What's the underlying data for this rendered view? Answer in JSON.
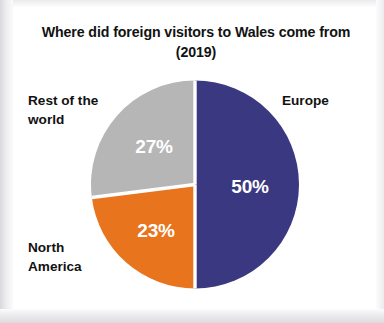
{
  "chart_data": {
    "type": "pie",
    "title": "Where did foreign visitors to Wales come from (2019)",
    "title_line1": "Where did foreign visitors to Wales come from",
    "title_line2": "(2019)",
    "xlabel": "",
    "ylabel": "",
    "legend_position": "outside-labels",
    "grid": false,
    "categories": [
      "Europe",
      "Rest of the world",
      "North America"
    ],
    "values": [
      50,
      27,
      23
    ],
    "value_labels": [
      "50%",
      "27%",
      "23%"
    ],
    "colors": [
      "#3a3880",
      "#b6b6b6",
      "#e8741e"
    ],
    "slices": [
      {
        "label": "Europe",
        "label_text": "Europe",
        "value": 50,
        "value_label": "50%",
        "color": "#3a3880",
        "start_angle_deg": 0,
        "end_angle_deg": 180
      },
      {
        "label": "North America",
        "label_text": "North\nAmerica",
        "value": 23,
        "value_label": "23%",
        "color": "#e8741e",
        "start_angle_deg": 180,
        "end_angle_deg": 262.8
      },
      {
        "label": "Rest of the world",
        "label_text": "Rest of the\nworld",
        "value": 27,
        "value_label": "27%",
        "color": "#b6b6b6",
        "start_angle_deg": 262.8,
        "end_angle_deg": 360
      }
    ],
    "total": 100,
    "units": "%",
    "separator_color": "#ffffff",
    "background": "#ffffff"
  }
}
